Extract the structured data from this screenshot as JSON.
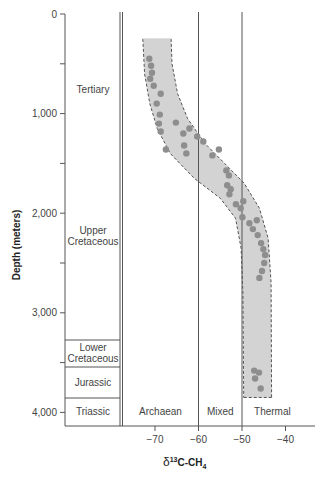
{
  "chart_data": {
    "type": "scatter",
    "title": "",
    "xlabel": "δ13C-CH4",
    "ylabel": "Depth (meters)",
    "xlim": [
      -77,
      -36
    ],
    "ylim": [
      0,
      4100
    ],
    "y_inverted": true,
    "x_ticks": [
      "−70",
      "−60",
      "−50",
      "−40"
    ],
    "x_tick_values": [
      -70,
      -60,
      -50,
      -40
    ],
    "y_ticks": [
      "0",
      "1,000",
      "2,000",
      "3,000",
      "4,000"
    ],
    "y_tick_values": [
      0,
      1000,
      2000,
      3000,
      4000
    ],
    "grid": false,
    "zones": [
      {
        "label": "Archaean",
        "x_range": [
          -77,
          -60
        ]
      },
      {
        "label": "Mixed",
        "x_range": [
          -60,
          -50
        ]
      },
      {
        "label": "Thermal",
        "x_range": [
          -50,
          -36
        ]
      }
    ],
    "strata": [
      {
        "label": "Tertiary",
        "depth_range": [
          0,
          1000
        ]
      },
      {
        "label": "Upper Cretaceous",
        "depth_range": [
          1000,
          3280
        ]
      },
      {
        "label": "Lower Cretaceous",
        "depth_range": [
          3280,
          3540
        ]
      },
      {
        "label": "Jurassic",
        "depth_range": [
          3540,
          3860
        ]
      },
      {
        "label": "Triassic",
        "depth_range": [
          3860,
          4140
        ]
      }
    ],
    "envelope": "shaded band with dashed border spanning from ~-73 to -66 at 250 m curving to ~-50 to -40 at 3850 m",
    "points": [
      {
        "x": -71.3,
        "y": 450
      },
      {
        "x": -70.9,
        "y": 520
      },
      {
        "x": -70.7,
        "y": 590
      },
      {
        "x": -71.1,
        "y": 650
      },
      {
        "x": -70.3,
        "y": 720
      },
      {
        "x": -68.7,
        "y": 800
      },
      {
        "x": -69.6,
        "y": 900
      },
      {
        "x": -68.9,
        "y": 1010
      },
      {
        "x": -69.1,
        "y": 1100
      },
      {
        "x": -68.7,
        "y": 1180
      },
      {
        "x": -65.2,
        "y": 1090
      },
      {
        "x": -67.5,
        "y": 1360
      },
      {
        "x": -63.5,
        "y": 1200
      },
      {
        "x": -63.3,
        "y": 1320
      },
      {
        "x": -62.8,
        "y": 1400
      },
      {
        "x": -62.1,
        "y": 1150
      },
      {
        "x": -60.3,
        "y": 1230
      },
      {
        "x": -58.9,
        "y": 1280
      },
      {
        "x": -56.8,
        "y": 1420
      },
      {
        "x": -55.3,
        "y": 1360
      },
      {
        "x": -53.6,
        "y": 1570
      },
      {
        "x": -53.0,
        "y": 1620
      },
      {
        "x": -53.4,
        "y": 1720
      },
      {
        "x": -52.6,
        "y": 1760
      },
      {
        "x": -52.9,
        "y": 1810
      },
      {
        "x": -51.4,
        "y": 1910
      },
      {
        "x": -50.3,
        "y": 1950
      },
      {
        "x": -49.7,
        "y": 1880
      },
      {
        "x": -49.9,
        "y": 2040
      },
      {
        "x": -48.3,
        "y": 2100
      },
      {
        "x": -47.5,
        "y": 2160
      },
      {
        "x": -46.6,
        "y": 2070
      },
      {
        "x": -46.4,
        "y": 2220
      },
      {
        "x": -45.6,
        "y": 2300
      },
      {
        "x": -45.1,
        "y": 2360
      },
      {
        "x": -44.7,
        "y": 2420
      },
      {
        "x": -44.9,
        "y": 2500
      },
      {
        "x": -45.4,
        "y": 2580
      },
      {
        "x": -46.0,
        "y": 2650
      },
      {
        "x": -47.2,
        "y": 3580
      },
      {
        "x": -47.0,
        "y": 3660
      },
      {
        "x": -46.1,
        "y": 3600
      },
      {
        "x": -45.7,
        "y": 3760
      }
    ]
  },
  "axes": {
    "x_label_prefix": "δ",
    "x_label_sup": "13",
    "x_label_main": "C-CH",
    "x_label_sub": "4",
    "y_label": "Depth (meters)"
  }
}
